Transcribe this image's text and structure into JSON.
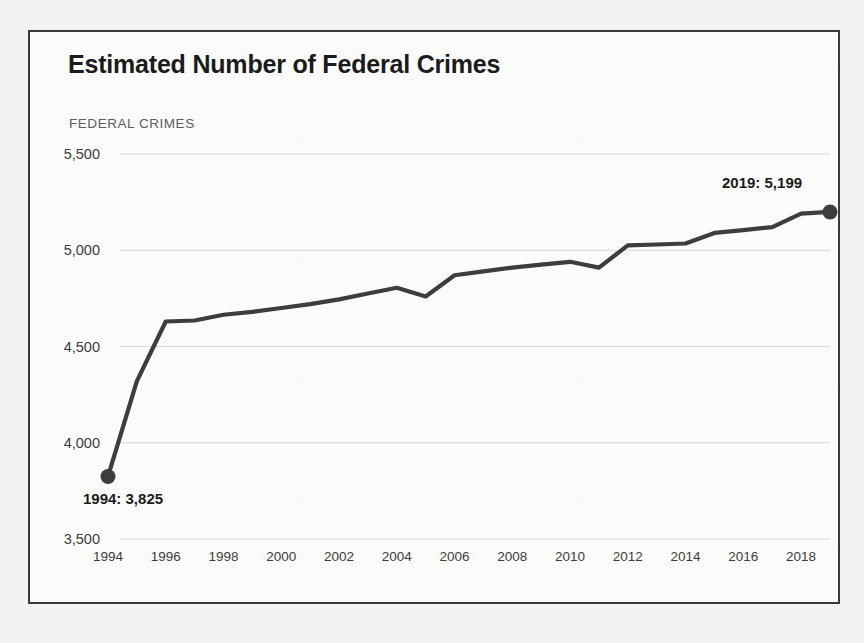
{
  "figure": {
    "title": "Estimated Number of Federal Crimes",
    "axis_caption": "FEDERAL CRIMES",
    "border_color": "#3a3a3a",
    "background_color": "#fbfbfa",
    "page_background": "#f3f2f0"
  },
  "annotations": {
    "start_label": "1994: 3,825",
    "end_label": "2019: 5,199"
  },
  "chart_data": {
    "type": "line",
    "title": "Estimated Number of Federal Crimes",
    "subtitle": "FEDERAL CRIMES",
    "xlabel": "",
    "ylabel": "FEDERAL CRIMES",
    "xlim": [
      1994,
      2019
    ],
    "ylim": [
      3500,
      5500
    ],
    "grid": true,
    "grid_axis": "y",
    "legend": false,
    "line_color": "#3d3d3d",
    "marker_color": "#3d3d3d",
    "y_ticks": [
      3500,
      4000,
      4500,
      5000,
      5500
    ],
    "y_tick_labels": [
      "3,500",
      "4,000",
      "4,500",
      "5,000",
      "5,500"
    ],
    "x_ticks": [
      1994,
      1996,
      1998,
      2000,
      2002,
      2004,
      2006,
      2008,
      2010,
      2012,
      2014,
      2016,
      2018
    ],
    "x_tick_labels": [
      "1994",
      "1996",
      "1998",
      "2000",
      "2002",
      "2004",
      "2006",
      "2008",
      "2010",
      "2012",
      "2014",
      "2016",
      "2018"
    ],
    "x": [
      1994,
      1995,
      1996,
      1997,
      1998,
      1999,
      2000,
      2001,
      2002,
      2003,
      2004,
      2005,
      2006,
      2007,
      2008,
      2009,
      2010,
      2011,
      2012,
      2013,
      2014,
      2015,
      2016,
      2017,
      2018,
      2019
    ],
    "values": [
      3825,
      4320,
      4630,
      4635,
      4665,
      4680,
      4700,
      4720,
      4745,
      4775,
      4805,
      4760,
      4870,
      4890,
      4910,
      4925,
      4940,
      4910,
      5025,
      5030,
      5035,
      5090,
      5105,
      5120,
      5190,
      5199
    ],
    "series": [
      {
        "name": "Estimated number of federal crimes",
        "values": [
          3825,
          4320,
          4630,
          4635,
          4665,
          4680,
          4700,
          4720,
          4745,
          4775,
          4805,
          4760,
          4870,
          4890,
          4910,
          4925,
          4940,
          4910,
          5025,
          5030,
          5035,
          5090,
          5105,
          5120,
          5190,
          5199
        ]
      }
    ],
    "annotated_points": [
      {
        "x": 1994,
        "y": 3825,
        "label": "1994: 3,825"
      },
      {
        "x": 2019,
        "y": 5199,
        "label": "2019: 5,199"
      }
    ]
  }
}
